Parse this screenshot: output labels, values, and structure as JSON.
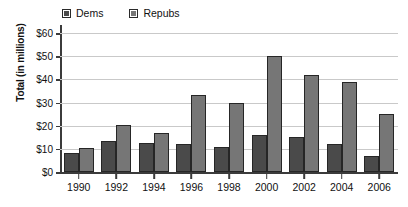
{
  "chart_data": {
    "type": "bar",
    "title": "",
    "xlabel": "",
    "ylabel": "Total (in millions)",
    "categories": [
      "1990",
      "1992",
      "1994",
      "1996",
      "1998",
      "2000",
      "2002",
      "2004",
      "2006"
    ],
    "series": [
      {
        "name": "Dems",
        "color": "#4a4a4a",
        "values": [
          8,
          13.5,
          12.5,
          12,
          11,
          16,
          15,
          12,
          7
        ]
      },
      {
        "name": "Repubs",
        "color": "#767676",
        "values": [
          10.3,
          20.2,
          16.7,
          33.4,
          29.7,
          50,
          41.7,
          39,
          25.2
        ]
      }
    ],
    "ylim": [
      0,
      60
    ],
    "ytick_values": [
      0,
      10,
      20,
      30,
      40,
      50,
      60
    ],
    "ytick_labels": [
      "$0",
      "$10",
      "$20",
      "$30",
      "$40",
      "$50",
      "$60"
    ],
    "grid": true,
    "legend_position": "top-left",
    "legend_entries": [
      "Dems",
      "Repubs"
    ]
  }
}
